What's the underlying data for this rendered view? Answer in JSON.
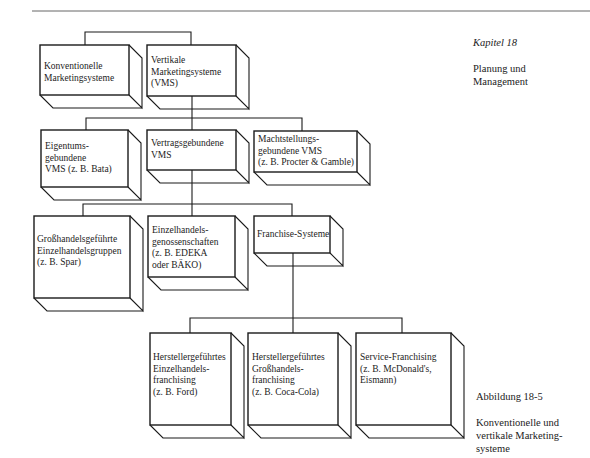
{
  "sidebar_top": {
    "chapter": "Kapitel 18",
    "title_lines": "Planung und\nManagement"
  },
  "caption": {
    "figure_number": "Abbildung 18-5",
    "text": "Konventionelle und\nvertikale Marketing-\nsysteme"
  },
  "nodes": {
    "konventionelle": {
      "label": "Konventionelle\nMarketingsysteme"
    },
    "vertikale": {
      "label": "Vertikale\nMarketingsysteme\n(VMS)"
    },
    "eigentum": {
      "label": "Eigentums-\ngebundene\nVMS (z. B. Bata)"
    },
    "vertrag": {
      "label": "Vertragsgebundene\nVMS"
    },
    "macht": {
      "label": "Machtstellungs-\ngebundene VMS\n(z. B. Procter & Gamble)"
    },
    "grosshandel_gruppen": {
      "label": "Großhandelsgeführte\nEinzelhandelsgruppen\n(z. B. Spar)"
    },
    "genossenschaften": {
      "label": "Einzelhandels-\ngenossenschaften\n(z. B. EDEKA\noder BÄKO)"
    },
    "franchise": {
      "label": "Franchise-Systeme"
    },
    "hersteller_einzel": {
      "label": "Herstellergeführtes\nEinzelhandels-\nfranchising\n(z. B. Ford)"
    },
    "hersteller_gross": {
      "label": "Herstellergeführtes\nGroßhandels-\nfranchising\n(z. B. Coca-Cola)"
    },
    "service": {
      "label": "Service-Franchising\n(z. B. McDonald's,\nEismann)"
    }
  },
  "style": {
    "line_color": "#1a1a1a",
    "background": "#ffffff"
  }
}
